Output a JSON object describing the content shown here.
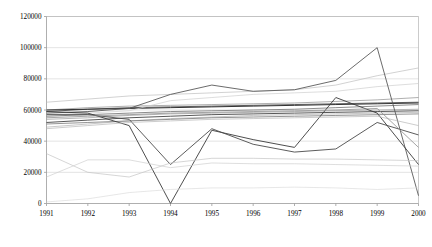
{
  "chart_data": {
    "type": "line",
    "title": "",
    "xlabel": "",
    "ylabel": "",
    "grid": true,
    "legend": "none",
    "categories": [
      "1991",
      "1992",
      "1993",
      "1994",
      "1995",
      "1996",
      "1997",
      "1998",
      "1999",
      "2000"
    ],
    "x": [
      1991,
      1992,
      1993,
      1994,
      1995,
      1996,
      1997,
      1998,
      1999,
      2000
    ],
    "ylim": [
      0,
      120000
    ],
    "xlim": [
      1991,
      2000
    ],
    "ytick_labels": [
      "0",
      "20000",
      "40000",
      "60000",
      "80000",
      "100000",
      "120000"
    ],
    "yticks": [
      0,
      20000,
      40000,
      60000,
      80000,
      100000,
      120000
    ],
    "xtick_labels": [
      "1991",
      "1992",
      "1993",
      "1994",
      "1995",
      "1996",
      "1997",
      "1998",
      "1999",
      "2000"
    ],
    "series": [
      {
        "name": "series-1",
        "color": "#bfbfbf",
        "width": 0.7,
        "values": [
          65000,
          67000,
          69000,
          70000,
          71000,
          72000,
          73000,
          76000,
          82000,
          87000
        ]
      },
      {
        "name": "series-2",
        "color": "#8c8c8c",
        "width": 0.7,
        "values": [
          60000,
          61500,
          62500,
          63000,
          63500,
          64000,
          64500,
          65500,
          66500,
          68000
        ]
      },
      {
        "name": "series-3",
        "color": "#555555",
        "width": 0.9,
        "values": [
          59000,
          60500,
          61500,
          62000,
          62500,
          63000,
          63500,
          64000,
          64500,
          65000
        ]
      },
      {
        "name": "series-4",
        "color": "#333333",
        "width": 1.0,
        "values": [
          60000,
          60500,
          61000,
          61500,
          62000,
          62500,
          63000,
          63500,
          64000,
          64500
        ]
      },
      {
        "name": "series-5",
        "color": "#6e6e6e",
        "width": 0.8,
        "values": [
          56000,
          57000,
          58000,
          59000,
          59500,
          60000,
          60500,
          61500,
          62500,
          63500
        ]
      },
      {
        "name": "series-6",
        "color": "#9a9a9a",
        "width": 0.7,
        "values": [
          54000,
          55000,
          56500,
          57500,
          58000,
          58500,
          59000,
          59500,
          60000,
          60500
        ]
      },
      {
        "name": "series-7",
        "color": "#444444",
        "width": 0.9,
        "values": [
          52000,
          53500,
          55000,
          56000,
          57000,
          57500,
          58000,
          58500,
          59000,
          59500
        ]
      },
      {
        "name": "series-8",
        "color": "#b0b0b0",
        "width": 0.7,
        "values": [
          49000,
          51000,
          53000,
          54500,
          55500,
          56500,
          57000,
          57500,
          58000,
          58500
        ]
      },
      {
        "name": "series-9",
        "color": "#7a7a7a",
        "width": 0.8,
        "values": [
          51000,
          52000,
          53000,
          54000,
          55000,
          55500,
          56000,
          56500,
          57000,
          57500
        ]
      },
      {
        "name": "series-10",
        "color": "#cfcfcf",
        "width": 0.7,
        "values": [
          57000,
          58000,
          59500,
          66000,
          68000,
          70000,
          71000,
          72000,
          75000,
          77000
        ]
      },
      {
        "name": "series-11",
        "color": "#5a5a5a",
        "width": 0.9,
        "values": [
          58000,
          59000,
          61000,
          70000,
          76000,
          72000,
          73000,
          79000,
          100000,
          5000
        ]
      },
      {
        "name": "series-12",
        "color": "#3a3a3a",
        "width": 0.9,
        "values": [
          59000,
          58000,
          50000,
          0,
          47000,
          41000,
          36000,
          68000,
          58000,
          25000
        ]
      },
      {
        "name": "series-13",
        "color": "#4a4a4a",
        "width": 0.9,
        "values": [
          57000,
          57000,
          54000,
          25000,
          48000,
          38000,
          33000,
          35000,
          52000,
          44000
        ]
      },
      {
        "name": "series-14",
        "color": "#c4c4c4",
        "width": 0.7,
        "values": [
          32000,
          20000,
          17000,
          26000,
          29000,
          29000,
          28500,
          28500,
          28000,
          27500
        ]
      },
      {
        "name": "series-15",
        "color": "#d0d0d0",
        "width": 0.7,
        "values": [
          17000,
          28000,
          28000,
          23000,
          26000,
          25500,
          25500,
          25000,
          24500,
          24000
        ]
      },
      {
        "name": "series-16",
        "color": "#dcdcdc",
        "width": 0.7,
        "values": [
          1000,
          3000,
          7000,
          9000,
          10000,
          10000,
          10500,
          10000,
          9000,
          10000
        ]
      },
      {
        "name": "series-17",
        "color": "#b8b8b8",
        "width": 0.7,
        "values": [
          48000,
          50000,
          52000,
          53000,
          54000,
          54500,
          55000,
          55500,
          56000,
          50000
        ]
      },
      {
        "name": "series-18",
        "color": "#8f8f8f",
        "width": 0.8,
        "values": [
          55000,
          56000,
          57000,
          58000,
          58500,
          59000,
          59500,
          60000,
          61000,
          36000
        ]
      }
    ]
  }
}
